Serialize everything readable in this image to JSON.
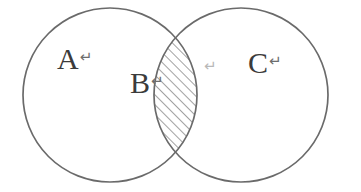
{
  "diagram": {
    "type": "venn-two-set",
    "background_color": "#ffffff",
    "stroke_color": "#6b6b6b",
    "hatch_color": "#8a8a8a",
    "label_color": "#3b3b3b",
    "return_symbol": "↵",
    "circles": [
      {
        "name": "left-circle",
        "label": "A",
        "cx": 110,
        "cy": 95,
        "r": 87
      },
      {
        "name": "right-circle",
        "label": "C",
        "cx": 241,
        "cy": 95,
        "r": 87
      }
    ],
    "intersection": {
      "name": "lens-region",
      "label": "B",
      "fill": "diagonal-hatch",
      "hatch_angle_deg": 45,
      "hatch_spacing_px": 7,
      "top_point": {
        "x": 188,
        "y": 33
      },
      "bottom_point": {
        "x": 188,
        "y": 158
      }
    },
    "labels": {
      "a": "A",
      "b": "B",
      "c": "C",
      "a_return": "↵",
      "b_return": "↵",
      "c_return": "↵",
      "intersection_return": "↵"
    }
  }
}
